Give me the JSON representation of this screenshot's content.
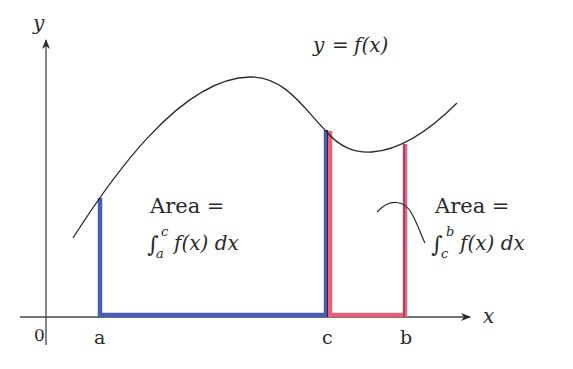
{
  "diagram": {
    "type": "definite-integral-additivity",
    "axes": {
      "x_label": "x",
      "y_label": "y",
      "origin_label": "0"
    },
    "curve": {
      "label": "y = f(x)",
      "label_parts": {
        "lhs": "y",
        "eq": "=",
        "rhs": "f(x)"
      },
      "color": "#2a2a2a"
    },
    "points": [
      {
        "id": "a",
        "label": "a"
      },
      {
        "id": "c",
        "label": "c"
      },
      {
        "id": "b",
        "label": "b"
      }
    ],
    "regions": [
      {
        "id": "a-to-c",
        "color": "#4a5db5",
        "label_line1": "Area =",
        "integral_sign": "∫",
        "lower": "a",
        "upper": "c",
        "integrand": "f(x) dx"
      },
      {
        "id": "c-to-b",
        "color": "#e8607e",
        "label_line1": "Area =",
        "integral_sign": "∫",
        "lower": "c",
        "upper": "b",
        "integrand": "f(x) dx"
      }
    ]
  }
}
